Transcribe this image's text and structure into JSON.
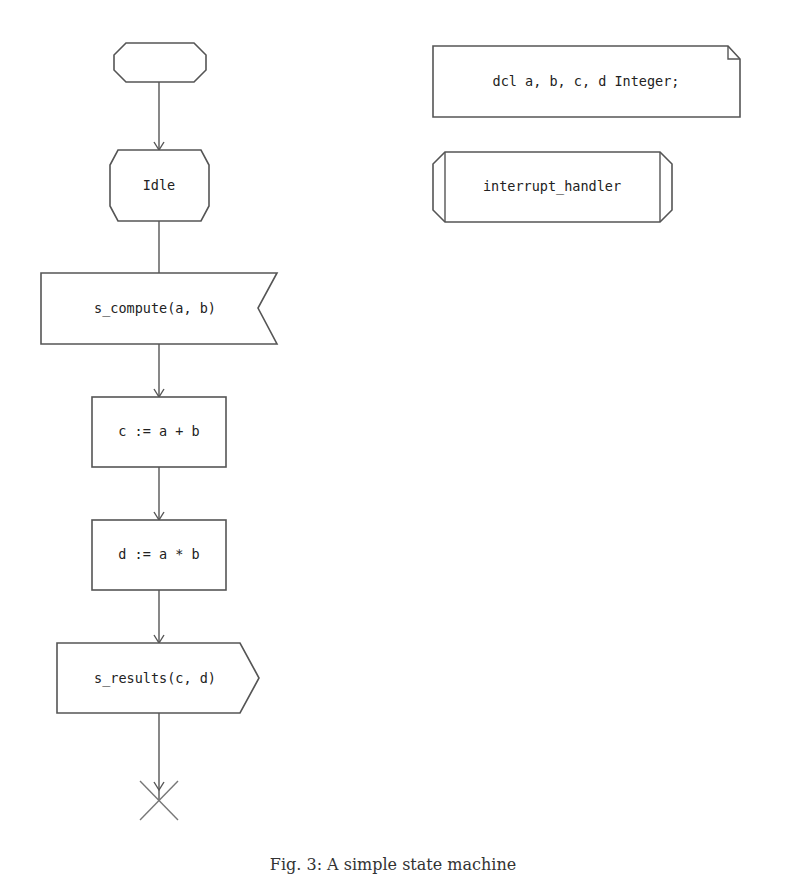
{
  "diagram": {
    "type": "SDL state machine",
    "nodes": {
      "start": {
        "kind": "start",
        "label": ""
      },
      "idle": {
        "kind": "state",
        "label": "Idle"
      },
      "input": {
        "kind": "input-signal",
        "label": "s_compute(a, b)"
      },
      "task1": {
        "kind": "task",
        "label": "c := a + b"
      },
      "task2": {
        "kind": "task",
        "label": "d := a * b"
      },
      "output": {
        "kind": "output-signal",
        "label": "s_results(c, d)"
      },
      "stop": {
        "kind": "stop",
        "label": ""
      }
    },
    "declarations": {
      "kind": "text-area",
      "label": "dcl a, b, c, d Integer;"
    },
    "procedure": {
      "kind": "procedure",
      "label": "interrupt_handler"
    },
    "edges": [
      {
        "from": "start",
        "to": "idle"
      },
      {
        "from": "idle",
        "to": "input"
      },
      {
        "from": "input",
        "to": "task1"
      },
      {
        "from": "task1",
        "to": "task2"
      },
      {
        "from": "task2",
        "to": "output"
      },
      {
        "from": "output",
        "to": "stop"
      }
    ]
  },
  "caption": "Fig. 3: A simple state machine"
}
